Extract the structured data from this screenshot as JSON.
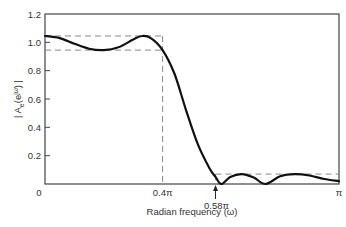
{
  "chart_data": {
    "type": "line",
    "title": "",
    "xlabel": "Radian frequency (ω)",
    "ylabel": "| A_e(e^{jω}) |",
    "xlim": [
      0,
      3.14159
    ],
    "ylim": [
      0,
      1.2
    ],
    "grid": false,
    "legend": null,
    "y_ticks": [
      {
        "value": 0.2,
        "label": "0.2"
      },
      {
        "value": 0.4,
        "label": "0.4"
      },
      {
        "value": 0.6,
        "label": "0.6"
      },
      {
        "value": 0.8,
        "label": "0.8"
      },
      {
        "value": 1.0,
        "label": "1.0"
      },
      {
        "value": 1.2,
        "label": "1.2"
      }
    ],
    "y_zero_label": "0",
    "x_ticks": [
      {
        "value_over_pi": 0,
        "label": "0"
      },
      {
        "value_over_pi": 0.4,
        "label": "0.4π"
      },
      {
        "value_over_pi": 0.58,
        "label": "0.58π"
      },
      {
        "value_over_pi": 1.0,
        "label": "π"
      }
    ],
    "annotations": {
      "passband_edge_over_pi": 0.4,
      "stopband_edge_over_pi": 0.58,
      "passband_upper": 1.045,
      "passband_lower": 0.945,
      "stopband_upper": 0.07
    },
    "series": [
      {
        "name": "|A_e(e^{jω})|",
        "x_over_pi": [
          0,
          0.05,
          0.1,
          0.15,
          0.2,
          0.25,
          0.3,
          0.33,
          0.36,
          0.4,
          0.44,
          0.48,
          0.52,
          0.56,
          0.58,
          0.6,
          0.63,
          0.67,
          0.71,
          0.75,
          0.8,
          0.85,
          0.9,
          0.95,
          1.0
        ],
        "values": [
          1.045,
          1.03,
          0.99,
          0.955,
          0.945,
          0.965,
          1.02,
          1.045,
          1.03,
          0.945,
          0.78,
          0.52,
          0.28,
          0.11,
          0.05,
          0.0,
          0.05,
          0.07,
          0.045,
          0.0,
          0.055,
          0.07,
          0.06,
          0.035,
          0.02
        ]
      }
    ]
  }
}
